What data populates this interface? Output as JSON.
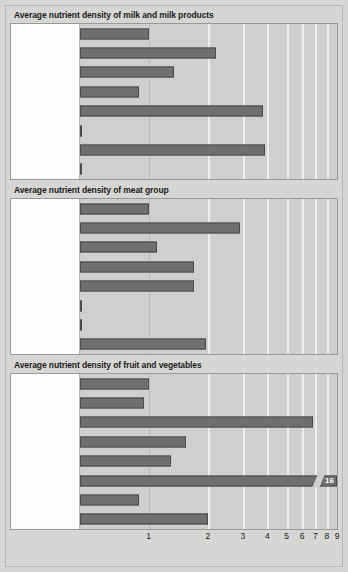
{
  "figure": {
    "axis_max_label": "9",
    "axis_ticks": [
      "1",
      "2",
      "3",
      "4",
      "5",
      "6",
      "7",
      "8",
      "9"
    ],
    "colors": {
      "bar_fill": "#6f6f6f",
      "bar_border": "#4a4a4a",
      "plot_background": "#cfcfcd",
      "label_background": "#fdfdfd",
      "page_background": "#d6d6d4",
      "gridline": "#eeeeec"
    }
  },
  "chart_data": [
    {
      "type": "bar",
      "title": "Average nutrient density of milk and milk products",
      "orientation": "horizontal",
      "xlabel": "",
      "ylabel": "",
      "xscale": "log",
      "xlim": [
        0.45,
        9
      ],
      "grid": true,
      "legend": "none",
      "categories": [
        "Energy",
        "Protein",
        "Vitamin A",
        "Thiamin",
        "Riboflavin",
        "Vitamin C",
        "Calcium",
        "Iron"
      ],
      "values": [
        1.0,
        2.2,
        1.35,
        0.9,
        3.8,
        0.05,
        3.9,
        0.2
      ]
    },
    {
      "type": "bar",
      "title": "Average nutrient density of meat group",
      "orientation": "horizontal",
      "xlabel": "",
      "ylabel": "",
      "xscale": "log",
      "xlim": [
        0.45,
        9
      ],
      "grid": true,
      "legend": "none",
      "categories": [
        "Energy",
        "Protein",
        "Vitamin A",
        "Thiamin",
        "Riboflavin",
        "Vitamin C",
        "Calcium",
        "Iron"
      ],
      "values": [
        1.0,
        2.9,
        1.1,
        1.7,
        1.7,
        0.04,
        0.35,
        1.95
      ]
    },
    {
      "type": "bar",
      "title": "Average nutrient density of fruit and vegetables",
      "orientation": "horizontal",
      "xlabel": "",
      "ylabel": "",
      "xscale": "log",
      "xlim": [
        0.45,
        9
      ],
      "grid": true,
      "legend": "none",
      "categories": [
        "Energy",
        "Protein",
        "Vitamin A",
        "Thiamin",
        "Riboflavin",
        "Vitamin C",
        "Calcium",
        "Iron"
      ],
      "values": [
        1.0,
        0.95,
        6.8,
        1.55,
        1.3,
        16,
        0.9,
        2.0
      ],
      "annotations": [
        {
          "category": "Vitamin C",
          "label": "16",
          "broken_axis": true
        }
      ]
    }
  ]
}
